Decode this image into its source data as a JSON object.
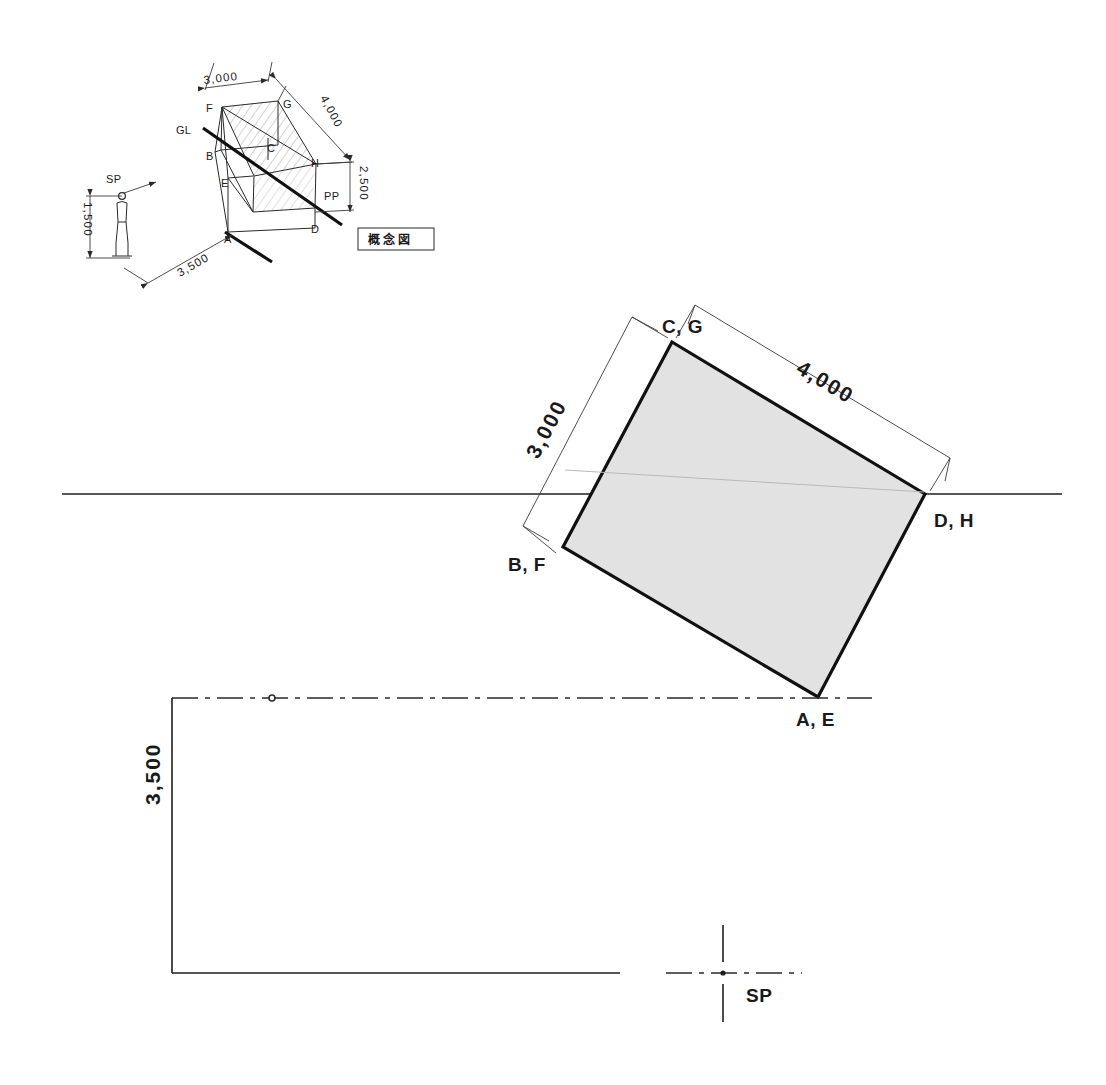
{
  "drawing": {
    "title_box_label": "概念図",
    "horizon_line_name": "horizon-line"
  },
  "concept_diagram": {
    "vertices": [
      {
        "id": "A",
        "label": "A"
      },
      {
        "id": "B",
        "label": "B"
      },
      {
        "id": "C",
        "label": "C"
      },
      {
        "id": "D",
        "label": "D"
      },
      {
        "id": "E",
        "label": "E"
      },
      {
        "id": "F",
        "label": "F"
      },
      {
        "id": "G",
        "label": "G"
      },
      {
        "id": "H",
        "label": "H"
      }
    ],
    "reference_labels": {
      "ground_line": "GL",
      "picture_plane": "PP",
      "standing_point": "SP"
    },
    "dimensions": {
      "width": "3,000",
      "depth": "4,000",
      "height": "2,500",
      "distance": "3,500",
      "eye_level": "1,500"
    }
  },
  "plan_view": {
    "corner_labels": {
      "top": "C, G",
      "right": "D, H",
      "bottom": "A, E",
      "left": "B, F"
    },
    "dimensions": {
      "left_side": "3,000",
      "top_side": "4,000"
    }
  },
  "bottom_view": {
    "dimension": "3,500",
    "standing_point_label": "SP"
  }
}
